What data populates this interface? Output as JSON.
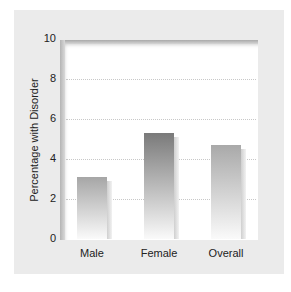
{
  "chart_data": {
    "type": "bar",
    "title": "",
    "xlabel": "",
    "ylabel": "Percentage with Disorder",
    "categories": [
      "Male",
      "Female",
      "Overall"
    ],
    "values": [
      3.1,
      5.3,
      4.7
    ],
    "ylim": [
      0,
      10
    ],
    "yticks": [
      "0",
      "2",
      "4",
      "6",
      "8",
      "10"
    ],
    "grid": "horizontal dotted at 2, 4, 6, 8",
    "legend": "none",
    "bar_colors": [
      "#a6a6a6",
      "#7a7a7a",
      "#a9a9a9"
    ]
  }
}
